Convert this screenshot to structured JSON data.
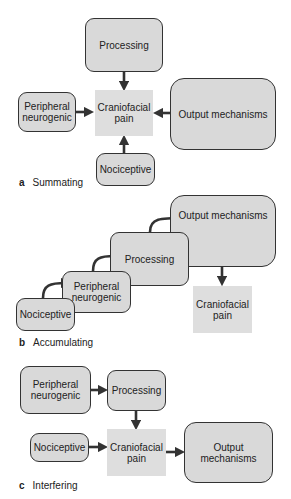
{
  "panels": [
    {
      "letter": "a",
      "title": "Summating",
      "nodes": {
        "processing": "Processing",
        "peripheral": "Peripheral neurogenic",
        "pain": "Craniofacial pain",
        "output": "Output mechanisms",
        "nociceptive": "Nociceptive"
      }
    },
    {
      "letter": "b",
      "title": "Accumulating",
      "nodes": {
        "nociceptive": "Nociceptive",
        "peripheral": "Peripheral neurogenic",
        "processing": "Processing",
        "output": "Output mechanisms",
        "pain": "Craniofacial pain"
      }
    },
    {
      "letter": "c",
      "title": "Interfering",
      "nodes": {
        "peripheral": "Peripheral neurogenic",
        "processing": "Processing",
        "nociceptive": "Nociceptive",
        "pain": "Craniofacial pain",
        "output": "Output mechanisms"
      }
    }
  ],
  "colors": {
    "box_fill": "#d9d9d9",
    "pain_fill": "#dedede",
    "arrow": "#333333"
  }
}
